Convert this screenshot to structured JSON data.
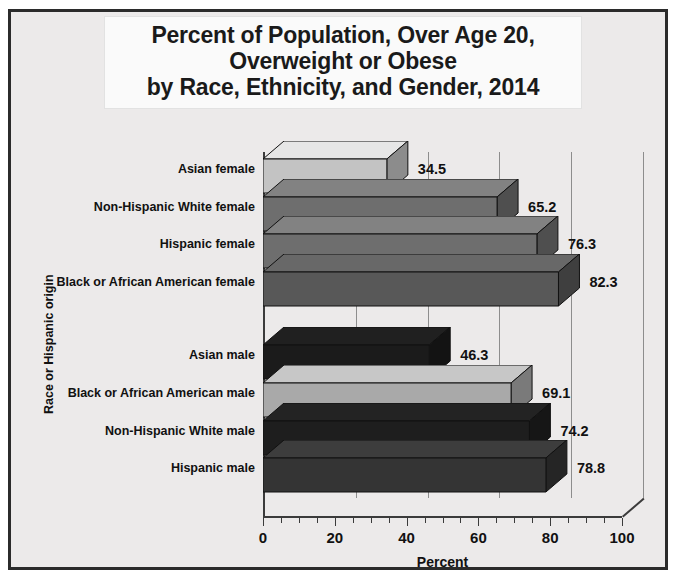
{
  "chart_data": {
    "type": "bar",
    "orientation": "horizontal",
    "title": "Percent of Population, Over Age 20, Overweight or Obese by Race, Ethnicity, and Gender, 2014",
    "title_lines": [
      "Percent of Population, Over Age 20,",
      "Overweight or Obese",
      "by Race, Ethnicity, and Gender, 2014"
    ],
    "xlabel": "Percent",
    "ylabel": "Race or Hispanic origin",
    "xlim": [
      0,
      100
    ],
    "xticks": [
      0,
      20,
      40,
      60,
      80,
      100
    ],
    "xticklabels": [
      "0",
      "20",
      "40",
      "60",
      "80",
      "100"
    ],
    "minor_tick_step": 5,
    "grid": "vertical",
    "legend": "none",
    "categories": [
      "Asian female",
      "Non-Hispanic White female",
      "Hispanic female",
      "Black or African American female",
      "Asian male",
      "Black or African American male",
      "Non-Hispanic White male",
      "Hispanic male"
    ],
    "values": [
      34.5,
      65.2,
      76.3,
      82.3,
      46.3,
      69.1,
      74.2,
      78.8
    ],
    "value_labels": [
      "34.5",
      "65.2",
      "76.3",
      "82.3",
      "46.3",
      "69.1",
      "74.2",
      "78.8"
    ],
    "bar_colors": [
      "#c3c3c3",
      "#6e6e6e",
      "#6e6e6e",
      "#585858",
      "#1b1b1b",
      "#a9a9a9",
      "#1e1e1e",
      "#343434"
    ],
    "groups": [
      {
        "name": "female",
        "categories": [
          "Asian female",
          "Non-Hispanic White female",
          "Hispanic female",
          "Black or African American female"
        ]
      },
      {
        "name": "male",
        "categories": [
          "Asian male",
          "Black or African American male",
          "Non-Hispanic White male",
          "Hispanic male"
        ]
      }
    ]
  },
  "style": {
    "frame_border_color": "#2b2b2b",
    "plot_background": "#eceaea",
    "title_background": "#fafafa",
    "gridline_color": "#8d8d8d",
    "axis_color": "#3b3b3b",
    "text_color": "#111111"
  }
}
